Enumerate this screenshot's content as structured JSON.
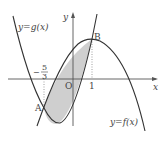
{
  "figure": {
    "type": "function-graph",
    "curves": [
      {
        "name": "g",
        "label": "y=g(x)",
        "shape": "upward parabola"
      },
      {
        "name": "f",
        "label": "y=f(x)",
        "shape": "downward parabola"
      }
    ],
    "axes": {
      "x_label": "x",
      "y_label": "y",
      "origin_label": "O"
    },
    "points": [
      {
        "name": "A",
        "x_value": "-5/3"
      },
      {
        "name": "B",
        "x_value": "1"
      }
    ],
    "tick_labels": {
      "neg_frac_sign": "−",
      "neg_frac_num": "5",
      "neg_frac_den": "3",
      "one": "1"
    },
    "shaded_region": "area enclosed between y=f(x) and y=g(x) from A to B",
    "colors": {
      "curve": "#333333",
      "axis": "#555555",
      "shade": "#cfcfcf"
    }
  },
  "labels": {
    "g_label": "y=g(x)",
    "f_label": "y=f(x)",
    "x_axis": "x",
    "y_axis": "y",
    "origin": "O",
    "point_a": "A",
    "point_b": "B"
  }
}
